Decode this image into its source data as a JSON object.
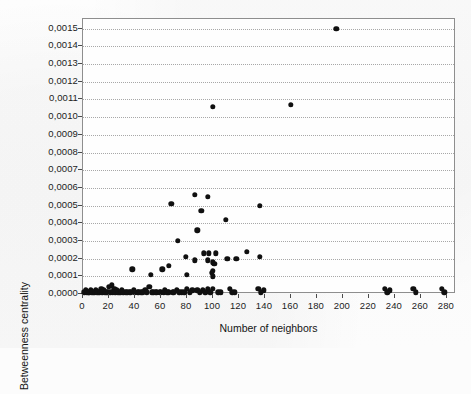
{
  "chart_data": {
    "type": "scatter",
    "title": "",
    "xlabel": "Number of neighbors",
    "ylabel": "Betweenness centrality",
    "xlim": [
      0,
      287
    ],
    "ylim": [
      0,
      0.001555
    ],
    "grid": "horizontal-dotted",
    "legend": "none",
    "marker": {
      "shape": "circle",
      "color": "#101010",
      "size_px": 5.4
    },
    "xticks": [
      0,
      20,
      40,
      60,
      80,
      100,
      120,
      140,
      160,
      180,
      200,
      220,
      240,
      260,
      280
    ],
    "xtick_labels": [
      "0",
      "20",
      "40",
      "60",
      "80",
      "100",
      "120",
      "140",
      "160",
      "180",
      "200",
      "220",
      "240",
      "260",
      "280"
    ],
    "yticks": [
      0.0,
      0.0001,
      0.0002,
      0.0003,
      0.0004,
      0.0005,
      0.0006,
      0.0007,
      0.0008,
      0.0009,
      0.001,
      0.0011,
      0.0012,
      0.0013,
      0.0014,
      0.0015
    ],
    "ytick_labels": [
      "0,0000",
      "0,0001",
      "0,0002",
      "0,0003",
      "0,0004",
      "0,0005",
      "0,0006",
      "0,0007",
      "0,0008",
      "0,0009",
      "0,0010",
      "0,0011",
      "0,0012",
      "0,0013",
      "0,0014",
      "0,0015"
    ],
    "points": [
      [
        195,
        0.0015
      ],
      [
        160,
        0.00107
      ],
      [
        100,
        0.00106
      ],
      [
        86,
        0.00056
      ],
      [
        96,
        0.00055
      ],
      [
        68,
        0.00051
      ],
      [
        136,
        0.0005
      ],
      [
        91,
        0.00047
      ],
      [
        110,
        0.00042
      ],
      [
        88,
        0.00036
      ],
      [
        73,
        0.0003
      ],
      [
        126,
        0.00024
      ],
      [
        102,
        0.00023
      ],
      [
        93,
        0.00023
      ],
      [
        97,
        0.00023
      ],
      [
        136,
        0.00021
      ],
      [
        79,
        0.00021
      ],
      [
        111,
        0.0002
      ],
      [
        118,
        0.0002
      ],
      [
        96,
        0.00019
      ],
      [
        86,
        0.00019
      ],
      [
        100,
        0.00018
      ],
      [
        101,
        0.00017
      ],
      [
        66,
        0.00016
      ],
      [
        38,
        0.00014
      ],
      [
        61,
        0.00014
      ],
      [
        100,
        0.00013
      ],
      [
        99,
        0.00012
      ],
      [
        80,
        0.00011
      ],
      [
        52,
        0.00011
      ],
      [
        100,
        0.0001
      ],
      [
        2,
        2e-05
      ],
      [
        4,
        1e-05
      ],
      [
        6,
        2e-05
      ],
      [
        8,
        1e-05
      ],
      [
        10,
        2e-05
      ],
      [
        12,
        1e-05
      ],
      [
        14,
        3e-05
      ],
      [
        16,
        2e-05
      ],
      [
        18,
        1e-05
      ],
      [
        20,
        4e-05
      ],
      [
        22,
        5e-05
      ],
      [
        24,
        3e-05
      ],
      [
        26,
        2e-05
      ],
      [
        28,
        1e-05
      ],
      [
        30,
        2e-05
      ],
      [
        33,
        1e-05
      ],
      [
        36,
        1e-05
      ],
      [
        39,
        2e-05
      ],
      [
        42,
        1e-05
      ],
      [
        45,
        1e-05
      ],
      [
        48,
        2e-05
      ],
      [
        51,
        4e-05
      ],
      [
        54,
        1e-05
      ],
      [
        57,
        1e-05
      ],
      [
        60,
        1e-05
      ],
      [
        63,
        2e-05
      ],
      [
        66,
        1e-05
      ],
      [
        69,
        1e-05
      ],
      [
        72,
        2e-05
      ],
      [
        76,
        1e-05
      ],
      [
        80,
        3e-05
      ],
      [
        84,
        2e-05
      ],
      [
        88,
        2e-05
      ],
      [
        92,
        2e-05
      ],
      [
        96,
        3e-05
      ],
      [
        100,
        3e-05
      ],
      [
        104,
        1e-05
      ],
      [
        113,
        3e-05
      ],
      [
        117,
        1e-05
      ],
      [
        135,
        3e-05
      ],
      [
        139,
        2e-05
      ],
      [
        232,
        3e-05
      ],
      [
        236,
        2e-05
      ],
      [
        254,
        3e-05
      ],
      [
        276,
        3e-05
      ],
      [
        1,
        1e-05
      ],
      [
        3,
        1e-05
      ],
      [
        5,
        1e-05
      ],
      [
        7,
        1e-05
      ],
      [
        9,
        1e-05
      ],
      [
        11,
        1e-05
      ],
      [
        13,
        1e-05
      ],
      [
        15,
        1e-05
      ],
      [
        17,
        1e-05
      ],
      [
        19,
        1e-05
      ],
      [
        21,
        1e-05
      ],
      [
        23,
        1e-05
      ],
      [
        25,
        1e-05
      ],
      [
        27,
        1e-05
      ],
      [
        29,
        1e-05
      ],
      [
        31,
        1e-05
      ],
      [
        34,
        1e-05
      ],
      [
        37,
        1e-05
      ],
      [
        40,
        1e-05
      ],
      [
        43,
        1e-05
      ],
      [
        46,
        1e-05
      ],
      [
        49,
        1e-05
      ],
      [
        53,
        1e-05
      ],
      [
        56,
        1e-05
      ],
      [
        59,
        1e-05
      ],
      [
        62,
        1e-05
      ],
      [
        65,
        1e-05
      ],
      [
        70,
        1e-05
      ],
      [
        74,
        1e-05
      ],
      [
        78,
        1e-05
      ],
      [
        82,
        1e-05
      ],
      [
        90,
        1e-05
      ],
      [
        94,
        1e-05
      ],
      [
        98,
        1e-05
      ],
      [
        106,
        1e-05
      ],
      [
        115,
        1e-05
      ],
      [
        137,
        1e-05
      ],
      [
        234,
        1e-05
      ],
      [
        256,
        1e-05
      ],
      [
        278,
        1e-05
      ]
    ]
  }
}
